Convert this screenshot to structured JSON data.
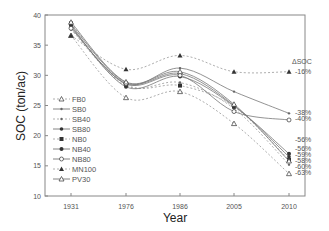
{
  "chart_data": {
    "type": "line",
    "title": "",
    "xlabel": "Year",
    "ylabel": "SOC (ton/ac)",
    "ylim": [
      10,
      40
    ],
    "yticks": [
      10,
      15,
      20,
      25,
      30,
      35,
      40
    ],
    "categories": [
      "1931",
      "1976",
      "1986",
      "2005",
      "2010"
    ],
    "grid": false,
    "legend_position": "left-inside",
    "series": [
      {
        "name": "FB0",
        "style": "dashed",
        "marker": "open-triangle",
        "values": [
          36.6,
          26.3,
          27.3,
          22.0,
          13.7
        ],
        "delta": "-63%"
      },
      {
        "name": "SB0",
        "style": "solid",
        "marker": "small-dot",
        "values": [
          38.0,
          28.6,
          31.2,
          27.3,
          23.7
        ],
        "delta": "-38%"
      },
      {
        "name": "SB40",
        "style": "dashed",
        "marker": "small-dot",
        "values": [
          37.6,
          28.3,
          28.8,
          24.5,
          15.2
        ],
        "delta": "-60%"
      },
      {
        "name": "SB80",
        "style": "solid",
        "marker": "filled-star",
        "values": [
          38.4,
          28.8,
          30.3,
          25.0,
          16.5
        ],
        "delta": "-56%"
      },
      {
        "name": "NB0",
        "style": "dashed",
        "marker": "filled-square",
        "values": [
          38.6,
          28.5,
          28.3,
          24.8,
          16.0
        ],
        "delta": "-58%"
      },
      {
        "name": "NB40",
        "style": "solid",
        "marker": "filled-circle",
        "values": [
          38.2,
          28.1,
          29.8,
          24.9,
          17.0
        ],
        "delta": "-56%"
      },
      {
        "name": "NB80",
        "style": "solid",
        "marker": "open-circle",
        "values": [
          37.8,
          28.6,
          30.0,
          24.0,
          22.6
        ],
        "delta": "-40%"
      },
      {
        "name": "MN100",
        "style": "dashed",
        "marker": "filled-triangle",
        "values": [
          36.6,
          31.0,
          33.3,
          30.6,
          30.6
        ],
        "delta": "-16%"
      },
      {
        "name": "PV30",
        "style": "solid",
        "marker": "open-triangle",
        "values": [
          38.8,
          28.9,
          30.6,
          25.2,
          15.8
        ],
        "delta": "-59%"
      }
    ],
    "annotations": {
      "header": "ΔSOC",
      "labels": [
        "-16%",
        "-38%",
        "-40%",
        "-56%",
        "-56%",
        "-59%",
        "-58%",
        "-60%",
        "-63%"
      ]
    }
  }
}
